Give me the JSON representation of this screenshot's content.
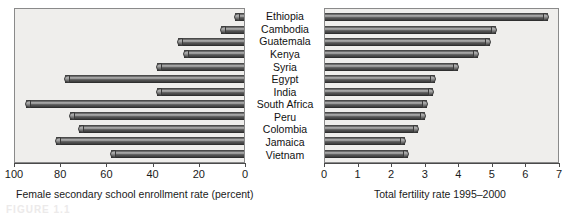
{
  "figure": {
    "caption_remnant": "FIGURE 1.1"
  },
  "chart_data": [
    {
      "type": "bar",
      "orientation": "horizontal",
      "panel": "left",
      "title": "",
      "xlabel": "Female secondary school enrollment rate (percent)",
      "ylabel": "",
      "xlim": [
        100,
        0
      ],
      "reversed_axis": true,
      "grid": false,
      "legend": false,
      "ticks": [
        100,
        80,
        60,
        40,
        20,
        0
      ],
      "tick_labels": [
        "100",
        "80",
        "60",
        "40",
        "20",
        "0"
      ],
      "categories": [
        "Ethiopia",
        "Cambodia",
        "Guatemala",
        "Kenya",
        "Syria",
        "Egypt",
        "India",
        "South Africa",
        "Peru",
        "Colombia",
        "Jamaica",
        "Vietnam"
      ],
      "values": [
        4,
        10,
        29,
        26,
        38,
        78,
        38,
        95,
        76,
        72,
        82,
        58
      ]
    },
    {
      "type": "bar",
      "orientation": "horizontal",
      "panel": "right",
      "title": "",
      "xlabel": "Total fertility rate 1995–2000",
      "ylabel": "",
      "xlim": [
        0,
        7
      ],
      "reversed_axis": false,
      "grid": false,
      "legend": false,
      "ticks": [
        0,
        1,
        2,
        3,
        4,
        5,
        6,
        7
      ],
      "tick_labels": [
        "0",
        "1",
        "2",
        "3",
        "4",
        "5",
        "6",
        "7"
      ],
      "categories": [
        "Ethiopia",
        "Cambodia",
        "Guatemala",
        "Kenya",
        "Syria",
        "Egypt",
        "India",
        "South Africa",
        "Peru",
        "Colombia",
        "Jamaica",
        "Vietnam"
      ],
      "values": [
        6.7,
        5.15,
        4.95,
        4.6,
        4.0,
        3.3,
        3.25,
        3.05,
        3.0,
        2.8,
        2.4,
        2.5
      ]
    }
  ],
  "colors": {
    "bar_fill": "#5e5e5e",
    "plot_background": "#efeeec",
    "axis": "#4a4a4a",
    "text": "#111111"
  }
}
